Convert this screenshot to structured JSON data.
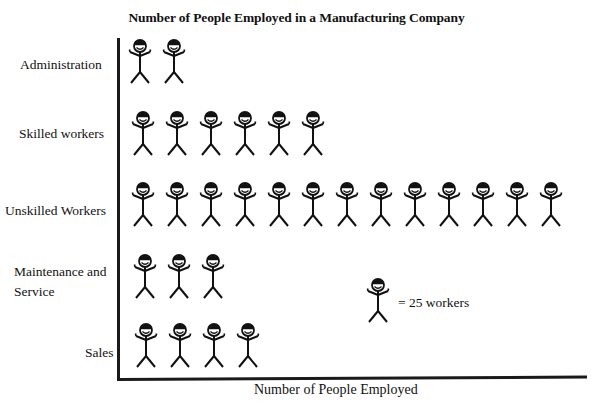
{
  "chart_data": {
    "type": "pictograph",
    "title": "Number of People Employed in a Manufacturing Company",
    "xlabel": "Number of People Employed",
    "ylabel": "",
    "icon": "stick-figure",
    "icon_value": 25,
    "legend": "= 25 workers",
    "categories": [
      "Administration",
      "Skilled workers",
      "Unskilled Workers",
      "Maintenance and Service",
      "Sales"
    ],
    "icon_counts": [
      2,
      6,
      13,
      3,
      4
    ],
    "values": [
      50,
      150,
      325,
      75,
      100
    ],
    "grid": false,
    "legend_position": "inside-right"
  },
  "title": "Number of People Employed in a Manufacturing Company",
  "xlabel": "Number of People Employed",
  "legend": {
    "text": "= 25 workers",
    "icon": "stick-figure-icon"
  },
  "rows": [
    {
      "label": "Administration",
      "count": 2
    },
    {
      "label": "Skilled workers",
      "count": 6
    },
    {
      "label": "Unskilled Workers",
      "count": 13
    },
    {
      "label_line1": "Maintenance and",
      "label_line2": "Service",
      "count": 3
    },
    {
      "label": "Sales",
      "count": 4
    }
  ]
}
